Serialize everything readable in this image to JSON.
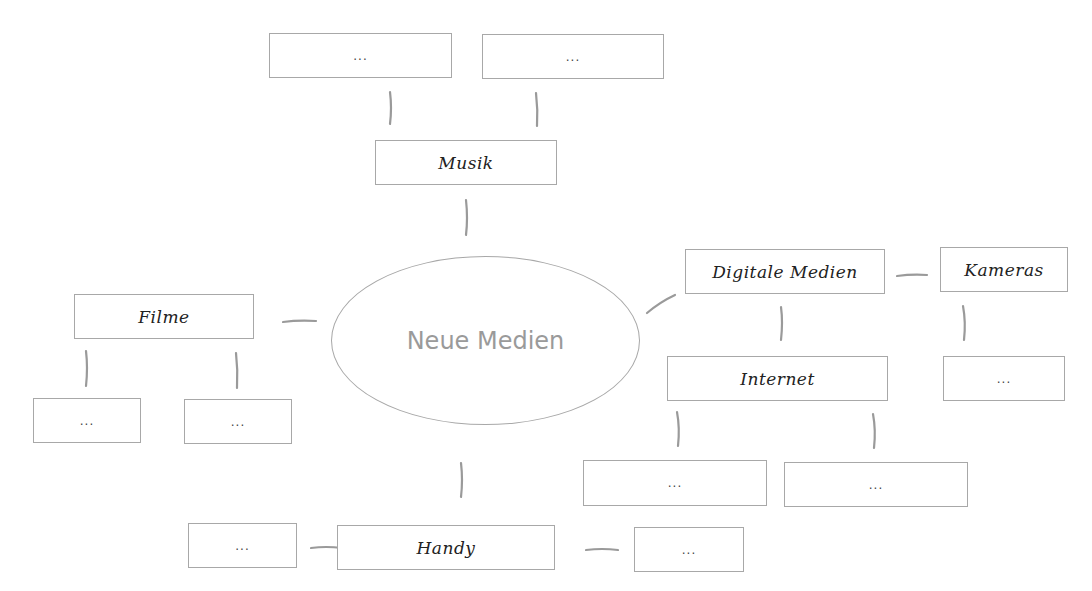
{
  "diagram": {
    "type": "mind-map",
    "center": {
      "label": "Neue Medien"
    },
    "nodes": {
      "musik": {
        "label": "Musik",
        "children": [
          "...",
          "..."
        ]
      },
      "filme": {
        "label": "Filme",
        "children": [
          "...",
          "..."
        ]
      },
      "digitale_medien": {
        "label": "Digitale Medien",
        "children": [
          "Internet",
          "Kameras"
        ]
      },
      "internet": {
        "label": "Internet",
        "children": [
          "...",
          "..."
        ]
      },
      "kameras": {
        "label": "Kameras",
        "children": [
          "..."
        ]
      },
      "handy": {
        "label": "Handy",
        "children": [
          "...",
          "..."
        ]
      }
    },
    "placeholder": "...",
    "colors": {
      "box_border": "#a8a8a8",
      "connector": "#9a9a9a",
      "center_text": "#9a9a9a",
      "label_text": "#222222"
    }
  }
}
